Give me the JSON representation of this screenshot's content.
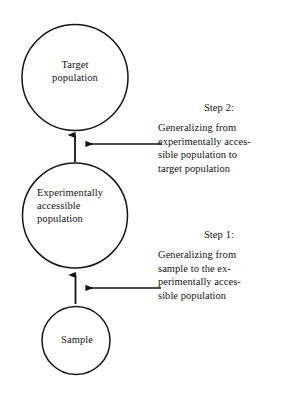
{
  "figure": {
    "type": "flow-diagram",
    "background_color": "#ffffff",
    "stroke_color": "#141414",
    "orientation": "vertical-bottom-up"
  },
  "nodes": [
    {
      "id": "target-population",
      "label": "Target\npopulation",
      "shape": "circle",
      "text_align": "center"
    },
    {
      "id": "experimentally-accessible-population",
      "label": "Experimentally\naccessible\npopulation",
      "shape": "circle",
      "text_align": "left"
    },
    {
      "id": "sample",
      "label": "Sample",
      "shape": "circle",
      "text_align": "center"
    }
  ],
  "steps": [
    {
      "id": "step-2",
      "heading": "Step 2:",
      "body": "Generalizing from\nexperimentally acces-\nsible population to\ntarget population",
      "from": "experimentally-accessible-population",
      "to": "target-population"
    },
    {
      "id": "step-1",
      "heading": "Step 1:",
      "body": "Generalizing from\nsample to the ex-\nperimentally acces-\nsible population",
      "from": "sample",
      "to": "experimentally-accessible-population"
    }
  ]
}
